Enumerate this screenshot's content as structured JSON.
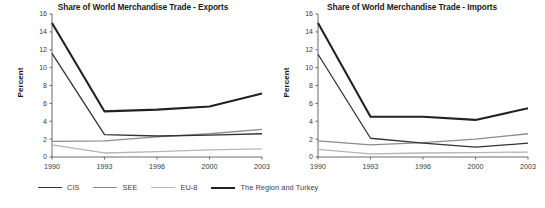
{
  "figure": {
    "ylabel": "Percent",
    "legend": {
      "position": "bottom-left",
      "items": [
        {
          "label": "CIS",
          "color": "#333333",
          "width": 1.3
        },
        {
          "label": "SEE",
          "color": "#8c8c8c",
          "width": 1.3
        },
        {
          "label": "EU-8",
          "color": "#b5b5b5",
          "width": 1.3
        },
        {
          "label": "The Region and Turkey",
          "color": "#222222",
          "width": 2.1
        }
      ]
    }
  },
  "chart_data": [
    {
      "type": "line",
      "title": "Share of World Merchandise Trade - Exports",
      "xlabel": "",
      "ylabel": "Percent",
      "x": [
        "1990",
        "1993",
        "1996",
        "2000",
        "2003"
      ],
      "xtick_labels": [
        "1990",
        "1993",
        "1996",
        "2000",
        "2003"
      ],
      "ytick_labels": [
        "0",
        "2",
        "4",
        "6",
        "8",
        "10",
        "12",
        "14",
        "16"
      ],
      "ylim": [
        0,
        16
      ],
      "ytick_step": 2,
      "grid": false,
      "legend_position": "bottom-left",
      "series": [
        {
          "name": "CIS",
          "color": "#333333",
          "width": 1.3,
          "values": [
            11.6,
            2.5,
            2.35,
            2.45,
            2.6
          ]
        },
        {
          "name": "SEE",
          "color": "#8c8c8c",
          "width": 1.3,
          "values": [
            1.75,
            1.8,
            2.25,
            2.6,
            3.1
          ]
        },
        {
          "name": "EU-8",
          "color": "#b5b5b5",
          "width": 1.3,
          "values": [
            1.35,
            0.45,
            0.6,
            0.8,
            0.9
          ]
        },
        {
          "name": "The Region and Turkey",
          "color": "#222222",
          "width": 2.1,
          "values": [
            15.0,
            5.1,
            5.3,
            5.65,
            7.1
          ]
        }
      ]
    },
    {
      "type": "line",
      "title": "Share of World Merchandise Trade - Imports",
      "xlabel": "",
      "ylabel": "Percent",
      "x": [
        "1990",
        "1993",
        "1996",
        "2000",
        "2003"
      ],
      "xtick_labels": [
        "1990",
        "1993",
        "1996",
        "2000",
        "2003"
      ],
      "ytick_labels": [
        "0",
        "2",
        "4",
        "6",
        "8",
        "10",
        "12",
        "14",
        "16"
      ],
      "ylim": [
        0,
        16
      ],
      "ytick_step": 2,
      "grid": false,
      "legend_position": "bottom-left",
      "series": [
        {
          "name": "CIS",
          "color": "#333333",
          "width": 1.3,
          "values": [
            11.5,
            2.1,
            1.55,
            1.1,
            1.55
          ]
        },
        {
          "name": "SEE",
          "color": "#8c8c8c",
          "width": 1.3,
          "values": [
            1.8,
            1.35,
            1.6,
            2.0,
            2.6
          ]
        },
        {
          "name": "EU-8",
          "color": "#b5b5b5",
          "width": 1.3,
          "values": [
            0.85,
            0.35,
            0.45,
            0.5,
            0.55
          ]
        },
        {
          "name": "The Region and Turkey",
          "color": "#222222",
          "width": 2.1,
          "values": [
            15.0,
            4.5,
            4.5,
            4.15,
            5.45
          ]
        }
      ]
    }
  ]
}
